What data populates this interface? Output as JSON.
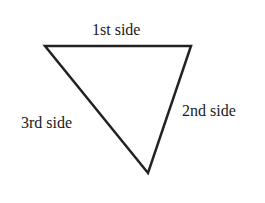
{
  "diagram": {
    "type": "triangle",
    "stroke_color": "#222222",
    "vertices": [
      [
        45,
        46
      ],
      [
        191,
        46
      ],
      [
        148,
        173
      ]
    ],
    "labels": {
      "side1": "1st side",
      "side2": "2nd side",
      "side3": "3rd side"
    }
  }
}
